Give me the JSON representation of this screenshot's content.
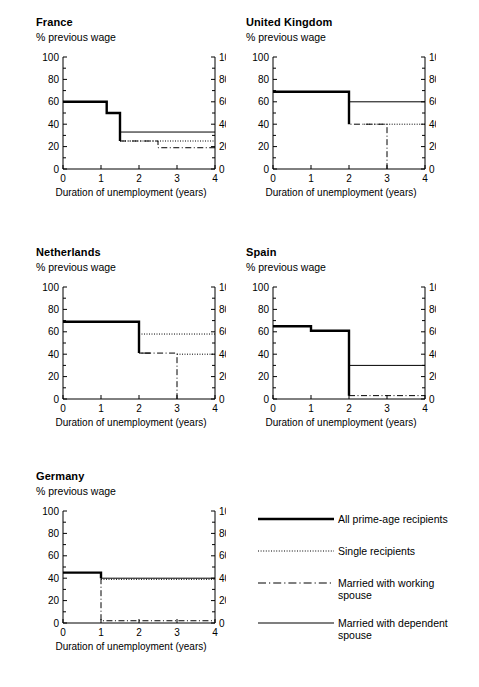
{
  "figure": {
    "x_axis_label": "Duration of unemployment (years)",
    "y_axis_label": "% previous wage",
    "y_ticks": [
      "0",
      "20",
      "40",
      "60",
      "80",
      "100"
    ],
    "x_ticks": [
      "0",
      "1",
      "2",
      "3",
      "4"
    ]
  },
  "panels": [
    {
      "id": "france",
      "title": "France"
    },
    {
      "id": "united-kingdom",
      "title": "United Kingdom"
    },
    {
      "id": "netherlands",
      "title": "Netherlands"
    },
    {
      "id": "spain",
      "title": "Spain"
    },
    {
      "id": "germany",
      "title": "Germany"
    }
  ],
  "legend": {
    "items": [
      {
        "id": "all-prime-age-recipients",
        "label": "All prime-age recipients",
        "style": "thick-solid"
      },
      {
        "id": "single-recipients",
        "label": "Single recipients",
        "style": "dotted"
      },
      {
        "id": "married-with-working-spouse",
        "label": "Married with working\nspouse",
        "style": "dash-dot"
      },
      {
        "id": "married-with-dependent-spouse",
        "label": "Married with dependent\nspouse",
        "style": "thin-solid"
      }
    ]
  },
  "chart_data": {
    "type": "line",
    "xlabel": "Duration of unemployment (years)",
    "ylabel": "% previous wage",
    "xlim": [
      0,
      4
    ],
    "ylim": [
      0,
      100
    ],
    "grid": false,
    "legend_position": "bottom-right",
    "step_style": "post",
    "panels": [
      {
        "name": "France",
        "series": [
          {
            "name": "All prime-age recipients",
            "style": "thick-solid",
            "points": [
              [
                0,
                60
              ],
              [
                1.15,
                60
              ],
              [
                1.15,
                50
              ],
              [
                1.5,
                50
              ],
              [
                1.5,
                25
              ]
            ]
          },
          {
            "name": "Married with dependent spouse",
            "style": "thin-solid",
            "points": [
              [
                1.5,
                33
              ],
              [
                4,
                33
              ]
            ]
          },
          {
            "name": "Single recipients",
            "style": "dotted",
            "points": [
              [
                1.5,
                25
              ],
              [
                4,
                25
              ]
            ]
          },
          {
            "name": "Married with working spouse",
            "style": "dash-dot",
            "points": [
              [
                1.5,
                25
              ],
              [
                2.5,
                25
              ],
              [
                2.5,
                19
              ],
              [
                4,
                19
              ]
            ]
          }
        ]
      },
      {
        "name": "United Kingdom",
        "series": [
          {
            "name": "All prime-age recipients",
            "style": "thick-solid",
            "points": [
              [
                0,
                69
              ],
              [
                2,
                69
              ],
              [
                2,
                40
              ]
            ]
          },
          {
            "name": "Married with dependent spouse",
            "style": "thin-solid",
            "points": [
              [
                2,
                60
              ],
              [
                4,
                60
              ]
            ]
          },
          {
            "name": "Single recipients",
            "style": "dotted",
            "points": [
              [
                2.4,
                40
              ],
              [
                4,
                40
              ]
            ]
          },
          {
            "name": "Married with working spouse",
            "style": "dash-dot",
            "points": [
              [
                2,
                57
              ],
              [
                2,
                40
              ],
              [
                3,
                40
              ],
              [
                3,
                0
              ]
            ]
          }
        ]
      },
      {
        "name": "Netherlands",
        "series": [
          {
            "name": "All prime-age recipients",
            "style": "thick-solid",
            "points": [
              [
                0,
                69
              ],
              [
                2,
                69
              ],
              [
                2,
                41
              ]
            ]
          },
          {
            "name": "Single recipients",
            "style": "dotted",
            "points": [
              [
                2,
                58
              ],
              [
                4,
                58
              ]
            ]
          },
          {
            "name": "Married with dependent spouse",
            "style": "thin-solid",
            "points": [
              [
                2,
                41
              ],
              [
                2.3,
                41
              ]
            ]
          },
          {
            "name": "Married with working spouse",
            "style": "dash-dot",
            "points": [
              [
                2,
                57
              ],
              [
                2,
                41
              ],
              [
                3,
                41
              ],
              [
                3,
                0
              ]
            ]
          },
          {
            "name": "Single recipients (lower)",
            "style": "dotted",
            "points": [
              [
                3,
                40
              ],
              [
                4,
                40
              ]
            ]
          }
        ]
      },
      {
        "name": "Spain",
        "series": [
          {
            "name": "All prime-age recipients",
            "style": "thick-solid",
            "points": [
              [
                0,
                65
              ],
              [
                1,
                65
              ],
              [
                1,
                61
              ],
              [
                2,
                61
              ],
              [
                2,
                3
              ]
            ]
          },
          {
            "name": "Married with dependent spouse",
            "style": "thin-solid",
            "points": [
              [
                2,
                30
              ],
              [
                4,
                30
              ]
            ]
          },
          {
            "name": "Married with working spouse",
            "style": "dash-dot",
            "points": [
              [
                2,
                3
              ],
              [
                4,
                3
              ]
            ]
          }
        ]
      },
      {
        "name": "Germany",
        "series": [
          {
            "name": "All prime-age recipients",
            "style": "thick-solid",
            "points": [
              [
                0,
                45
              ],
              [
                1,
                45
              ],
              [
                1,
                40
              ]
            ]
          },
          {
            "name": "Married with dependent spouse",
            "style": "thin-solid",
            "points": [
              [
                1,
                40
              ],
              [
                4,
                40
              ]
            ]
          },
          {
            "name": "Single recipients",
            "style": "dotted",
            "points": [
              [
                1,
                39
              ],
              [
                4,
                39
              ]
            ]
          },
          {
            "name": "Married with working spouse",
            "style": "dash-dot",
            "points": [
              [
                1,
                40
              ],
              [
                1,
                2
              ],
              [
                4,
                2
              ]
            ]
          }
        ]
      }
    ]
  }
}
